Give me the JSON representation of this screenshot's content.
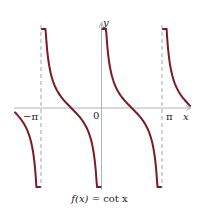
{
  "chart_data": {
    "type": "line",
    "title": "f(x) = cot x",
    "function": "cot x",
    "xlabel": "x",
    "ylabel": "y",
    "xlim": [
      -4.5,
      4.6
    ],
    "ylim": [
      -4.1,
      4.1
    ],
    "grid": false,
    "legend": null,
    "tick_labels": {
      "x": [
        {
          "value": -3.14159,
          "label": "−π"
        },
        {
          "value": 0,
          "label": "0"
        },
        {
          "value": 3.14159,
          "label": "π"
        }
      ]
    },
    "asymptotes": [
      -3.14159,
      0,
      3.14159
    ],
    "asymptote_style": "dashed",
    "branches": [
      {
        "from": -4.49,
        "to": -3.19
      },
      {
        "from": -3.09,
        "to": -0.05
      },
      {
        "from": 0.05,
        "to": 3.09
      },
      {
        "from": 3.19,
        "to": 4.6
      }
    ],
    "series": [
      {
        "name": "cot x",
        "color": "#7a1a24"
      }
    ],
    "sample_points": [
      {
        "x": -1.5708,
        "y": 0
      },
      {
        "x": 1.5708,
        "y": 0
      },
      {
        "x": -0.7854,
        "y": -1
      },
      {
        "x": 0.7854,
        "y": 1
      },
      {
        "x": 2.3562,
        "y": -1
      },
      {
        "x": -2.3562,
        "y": 1
      }
    ]
  },
  "labels": {
    "y_axis": "y",
    "x_axis": "x",
    "neg_pi": "−π",
    "zero": "0",
    "pi": "π",
    "caption_lhs": "f(x)",
    "caption_rhs": " = cot x"
  },
  "colors": {
    "curve": "#7a1a24",
    "axis": "#9aa0a8",
    "asymptote": "#8a8f96"
  }
}
